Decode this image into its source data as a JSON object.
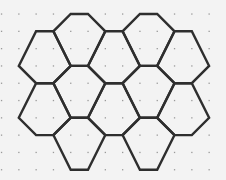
{
  "diagram": {
    "type": "pentagonal-hexagonal-tiling-on-dot-grid",
    "background": "#f3f3f3",
    "dot_color": "#9a9a9a",
    "line_color": "#2e2e2e",
    "line_width": 2.4,
    "grid": {
      "origin_x": 1.5,
      "origin_y": 14,
      "spacing": 17.3,
      "cols": 13,
      "rows": 10
    },
    "shapes": [
      {
        "name": "hex-top-left",
        "points": [
          [
            4,
            0
          ],
          [
            5,
            0
          ],
          [
            6,
            1
          ],
          [
            5,
            3
          ],
          [
            4,
            3
          ],
          [
            3,
            1
          ]
        ]
      },
      {
        "name": "hex-top-right",
        "points": [
          [
            8,
            0
          ],
          [
            9,
            0
          ],
          [
            10,
            1
          ],
          [
            9,
            3
          ],
          [
            8,
            3
          ],
          [
            7,
            1
          ]
        ]
      },
      {
        "name": "hex-mid-left",
        "points": [
          [
            2,
            1
          ],
          [
            3,
            1
          ],
          [
            4,
            3
          ],
          [
            3,
            4
          ],
          [
            2,
            4
          ],
          [
            1,
            3
          ]
        ]
      },
      {
        "name": "hex-mid-center",
        "points": [
          [
            6,
            1
          ],
          [
            7,
            1
          ],
          [
            8,
            3
          ],
          [
            7,
            4
          ],
          [
            6,
            4
          ],
          [
            5,
            3
          ]
        ]
      },
      {
        "name": "hex-mid-right",
        "points": [
          [
            10,
            1
          ],
          [
            11,
            1
          ],
          [
            12,
            3
          ],
          [
            11,
            4
          ],
          [
            10,
            4
          ],
          [
            9,
            3
          ]
        ]
      },
      {
        "name": "hex-row3-a",
        "points": [
          [
            4,
            3
          ],
          [
            5,
            3
          ],
          [
            6,
            4
          ],
          [
            5,
            6
          ],
          [
            4,
            6
          ],
          [
            3,
            4
          ]
        ]
      },
      {
        "name": "hex-row3-b",
        "points": [
          [
            8,
            3
          ],
          [
            9,
            3
          ],
          [
            10,
            4
          ],
          [
            9,
            6
          ],
          [
            8,
            6
          ],
          [
            7,
            4
          ]
        ]
      },
      {
        "name": "hex-row4-left",
        "points": [
          [
            2,
            4
          ],
          [
            3,
            4
          ],
          [
            4,
            6
          ],
          [
            3,
            7
          ],
          [
            2,
            7
          ],
          [
            1,
            6
          ]
        ]
      },
      {
        "name": "hex-row4-center",
        "points": [
          [
            6,
            4
          ],
          [
            7,
            4
          ],
          [
            8,
            6
          ],
          [
            7,
            7
          ],
          [
            6,
            7
          ],
          [
            5,
            6
          ]
        ]
      },
      {
        "name": "hex-row4-right",
        "points": [
          [
            10,
            4
          ],
          [
            11,
            4
          ],
          [
            12,
            6
          ],
          [
            11,
            7
          ],
          [
            10,
            7
          ],
          [
            9,
            6
          ]
        ]
      },
      {
        "name": "hex-bottom-left",
        "points": [
          [
            4,
            6
          ],
          [
            5,
            6
          ],
          [
            6,
            7
          ],
          [
            5,
            9
          ],
          [
            4,
            9
          ],
          [
            3,
            7
          ]
        ]
      },
      {
        "name": "hex-bottom-right",
        "points": [
          [
            8,
            6
          ],
          [
            9,
            6
          ],
          [
            10,
            7
          ],
          [
            9,
            9
          ],
          [
            8,
            9
          ],
          [
            7,
            7
          ]
        ]
      }
    ]
  }
}
